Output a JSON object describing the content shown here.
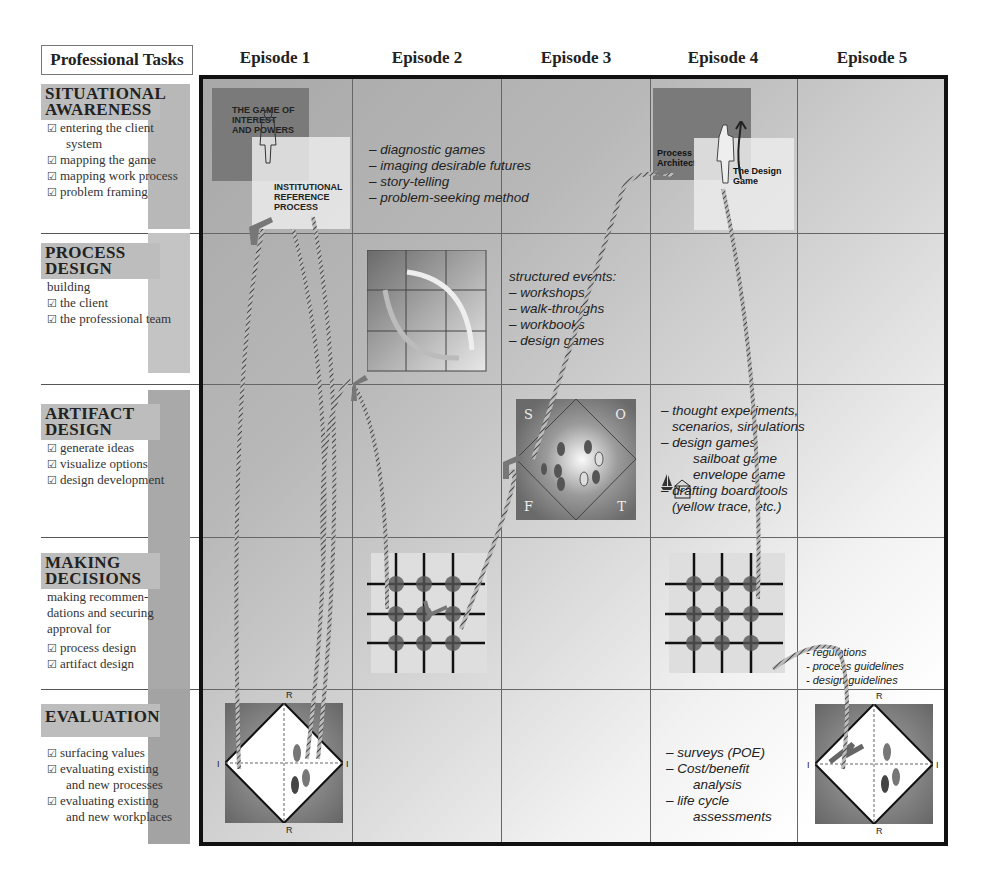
{
  "header": {
    "professional_tasks": "Professional Tasks",
    "episodes": [
      "Episode 1",
      "Episode 2",
      "Episode 3",
      "Episode 4",
      "Episode 5"
    ]
  },
  "tasks": [
    {
      "title_lines": [
        "SITUATIONAL",
        "AWARENESS"
      ],
      "intro": "",
      "items": [
        [
          "entering the client",
          "system"
        ],
        [
          "mapping the game"
        ],
        [
          "mapping work process"
        ],
        [
          "problem framing"
        ]
      ]
    },
    {
      "title_lines": [
        "PROCESS",
        "DESIGN"
      ],
      "intro": "building",
      "items": [
        [
          "the client"
        ],
        [
          "the professional team"
        ]
      ]
    },
    {
      "title_lines": [
        "ARTIFACT",
        "DESIGN"
      ],
      "intro": "",
      "items": [
        [
          "generate ideas"
        ],
        [
          "visualize options"
        ],
        [
          "design development"
        ]
      ]
    },
    {
      "title_lines": [
        "MAKING",
        "DECISIONS"
      ],
      "intro_lines": [
        "making recommen-",
        "dations and securing",
        "approval for"
      ],
      "items": [
        [
          "process design"
        ],
        [
          "artifact design"
        ]
      ]
    },
    {
      "title_lines": [
        "EVALUATION"
      ],
      "intro": "",
      "items": [
        [
          "surfacing values"
        ],
        [
          "evaluating existing",
          "and new processes"
        ],
        [
          "evaluating existing",
          "and new workplaces"
        ]
      ]
    }
  ],
  "checkbox_glyph": "☑",
  "cells": {
    "e1_situational": {
      "box1": [
        "THE GAME OF",
        "INTEREST",
        "AND POWERS"
      ],
      "box2": [
        "INSTITUTIONAL",
        "REFERENCE",
        "PROCESS"
      ]
    },
    "e2_situational": [
      "– diagnostic games",
      "– imaging desirable futures",
      "– story-telling",
      "– problem-seeking method"
    ],
    "e3_process": [
      "structured events:",
      "– workshops",
      "– walk-throughs",
      "– workbooks",
      "– design games"
    ],
    "e3_artifact_swot": [
      "S",
      "O",
      "F",
      "T"
    ],
    "e4_situational": {
      "label1": [
        "Process",
        "Architect"
      ],
      "label2": [
        "The Design",
        "Game"
      ]
    },
    "e4_artifact": [
      "– thought experiments,",
      "scenarios, simulations",
      "– design games",
      "sailboat game",
      "envelope game",
      "– drafting board tools",
      "(yellow trace, etc.)"
    ],
    "e5_decisions": [
      "- regulations",
      "- process guidelines",
      "- design guidelines"
    ],
    "e4_evaluation": [
      "– surveys (POE)",
      "– Cost/benefit",
      "analysis",
      "– life cycle",
      "assessments"
    ],
    "axis_labels": {
      "top": "R",
      "bottom": "R",
      "left": "I",
      "right": "I"
    }
  },
  "colors": {
    "dark_gray": "#6e6e6e",
    "mid_gray": "#9a9a9a",
    "light_panel": "#e4e4e4",
    "border": "#111111"
  }
}
